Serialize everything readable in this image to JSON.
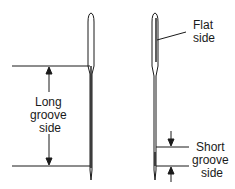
{
  "diagram": {
    "left_needle": {
      "label_lines": [
        "Long",
        "groove",
        "side"
      ]
    },
    "right_needle": {
      "flat_label_lines": [
        "Flat",
        "side"
      ],
      "short_label_lines": [
        "Short",
        "groove",
        "side"
      ]
    },
    "colors": {
      "ink": "#1a1a1a",
      "background": "#ffffff"
    }
  }
}
